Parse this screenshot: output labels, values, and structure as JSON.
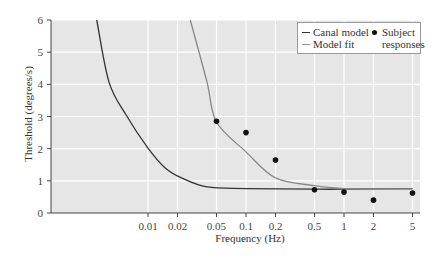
{
  "chart_data": {
    "type": "line",
    "title": "",
    "xlabel": "Frequency (Hz)",
    "ylabel": "Threshold (degrees/s)",
    "x_scale": "log",
    "x_ticks": [
      0.01,
      0.02,
      0.05,
      0.1,
      0.2,
      0.5,
      1,
      2,
      5
    ],
    "x_tick_labels": [
      "0.01",
      "0.02",
      "0.05",
      "0.1",
      "0.2",
      "0.5",
      "1",
      "2",
      "5"
    ],
    "y_ticks": [
      0,
      1,
      2,
      3,
      4,
      5,
      6
    ],
    "ylim": [
      0,
      6
    ],
    "xlim": [
      0.0011,
      6.5
    ],
    "grid": true,
    "legend_position": "upper right",
    "series": [
      {
        "name": "Canal model",
        "kind": "line",
        "color": "#333333",
        "x": [
          0.003,
          0.004,
          0.006,
          0.01,
          0.015,
          0.022,
          0.04,
          0.1,
          0.5,
          1,
          5
        ],
        "y": [
          6.0,
          4.07,
          3.04,
          2.02,
          1.4,
          1.09,
          0.81,
          0.76,
          0.74,
          0.74,
          0.76
        ]
      },
      {
        "name": "Model fit",
        "kind": "line",
        "color": "#888888",
        "x": [
          0.027,
          0.04,
          0.05,
          0.1,
          0.2,
          0.5,
          1,
          2,
          5
        ],
        "y": [
          6.0,
          4.07,
          2.83,
          1.9,
          1.09,
          0.85,
          0.76,
          0.75,
          0.75
        ]
      },
      {
        "name": "Subject responses",
        "kind": "scatter",
        "color": "#111111",
        "x": [
          0.05,
          0.1,
          0.2,
          0.5,
          1,
          2,
          5
        ],
        "y": [
          2.85,
          2.5,
          1.65,
          0.72,
          0.65,
          0.4,
          0.62
        ]
      }
    ]
  },
  "legend": {
    "canal": "Canal model",
    "fit": "Model fit",
    "subject_line1": "Subject",
    "subject_line2": "responses"
  }
}
